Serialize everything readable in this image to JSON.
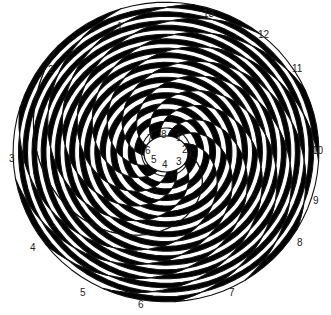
{
  "diagram": {
    "title": "",
    "type": "phyllotaxis-spiral",
    "colors": {
      "dark": "#000000",
      "light": "#ffffff",
      "outline": "#111111",
      "label": "#222222"
    },
    "center": {
      "x": 166,
      "y": 152
    },
    "outer_spirals": {
      "count": 13,
      "labels": [
        "1",
        "2",
        "3",
        "4",
        "5",
        "6",
        "7",
        "8",
        "9",
        "10",
        "11",
        "12",
        "13"
      ]
    },
    "inner_spirals": {
      "count": 8,
      "labels": [
        "1",
        "2",
        "3",
        "4",
        "5",
        "6",
        "7",
        "8"
      ]
    }
  },
  "outer_labels": [
    {
      "text": "1",
      "x": 117,
      "y": 22
    },
    {
      "text": "2",
      "x": 48,
      "y": 65
    },
    {
      "text": "3",
      "x": 9,
      "y": 154
    },
    {
      "text": "4",
      "x": 30,
      "y": 243
    },
    {
      "text": "5",
      "x": 80,
      "y": 288
    },
    {
      "text": "6",
      "x": 138,
      "y": 300
    },
    {
      "text": "7",
      "x": 229,
      "y": 288
    },
    {
      "text": "8",
      "x": 297,
      "y": 238
    },
    {
      "text": "9",
      "x": 313,
      "y": 196
    },
    {
      "text": "10",
      "x": 312,
      "y": 146
    },
    {
      "text": "11",
      "x": 292,
      "y": 64
    },
    {
      "text": "12",
      "x": 258,
      "y": 30
    },
    {
      "text": "13",
      "x": 203,
      "y": 9
    }
  ],
  "inner_labels": [
    {
      "text": "1",
      "x": 176,
      "y": 133
    },
    {
      "text": "2",
      "x": 182,
      "y": 145
    },
    {
      "text": "3",
      "x": 176,
      "y": 157
    },
    {
      "text": "4",
      "x": 162,
      "y": 160
    },
    {
      "text": "5",
      "x": 151,
      "y": 155
    },
    {
      "text": "6",
      "x": 145,
      "y": 146
    },
    {
      "text": "7",
      "x": 147,
      "y": 134
    },
    {
      "text": "8",
      "x": 161,
      "y": 130
    }
  ]
}
